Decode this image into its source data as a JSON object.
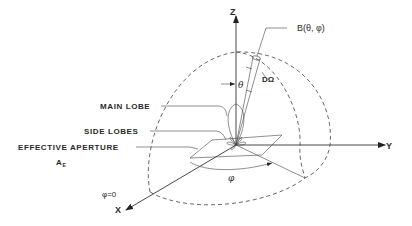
{
  "diagram": {
    "type": "antenna radiation pattern in spherical coordinates",
    "axes": {
      "z_label": "Z",
      "y_label": "Y",
      "x_label": "X"
    },
    "labels": {
      "main_lobe": "MAIN LOBE",
      "side_lobes": "SIDE LOBES",
      "effective_aperture": "EFFECTIVE APERTURE",
      "aperture_symbol": "A",
      "aperture_subscript": "E",
      "brightness": "B(θ, φ)",
      "solid_angle": "DΩ",
      "theta": "θ",
      "phi": "φ",
      "phi_zero": "φ=0"
    },
    "colors": {
      "ink": "#2a2a2a",
      "background": "#ffffff"
    }
  }
}
